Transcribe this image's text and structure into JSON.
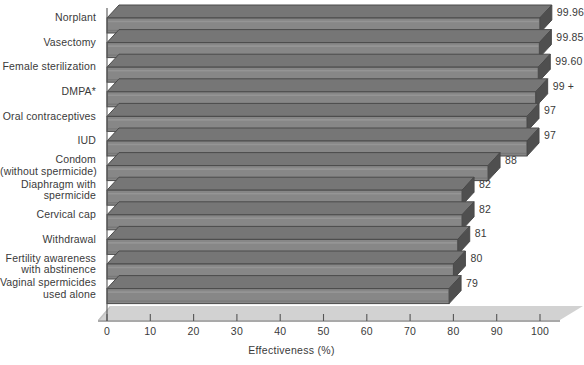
{
  "chart_data": {
    "type": "bar",
    "orientation": "horizontal",
    "title": "",
    "xlabel": "Effectiveness (%)",
    "ylabel": "",
    "xlim": [
      0,
      100
    ],
    "xticks": [
      0,
      10,
      20,
      30,
      40,
      50,
      60,
      70,
      80,
      90,
      100
    ],
    "xtick_labels": [
      "0",
      "10",
      "20",
      "30",
      "40",
      "50",
      "60",
      "70",
      "80",
      "90",
      "100"
    ],
    "grid": false,
    "legend": "none",
    "style": "3d-horizontal-bars-grayscale",
    "categories": [
      "Norplant",
      "Vasectomy",
      "Female sterilization",
      "DMPA*",
      "Oral contraceptives",
      "IUD",
      "Condom\n(without spermicide)",
      "Diaphragm with\nspermicide",
      "Cervical cap",
      "Withdrawal",
      "Fertility awareness\nwith abstinence",
      "Vaginal spermicides\nused alone"
    ],
    "values": [
      99.96,
      99.85,
      99.6,
      99,
      97,
      97,
      88,
      82,
      82,
      81,
      80,
      79
    ],
    "value_labels": [
      "99.96",
      "99.85",
      "99.60",
      "99 +",
      "97",
      "97",
      "88",
      "82",
      "82",
      "81",
      "80",
      "79"
    ],
    "colors": {
      "bar_front": "#878787",
      "bar_top": "#767676",
      "bar_side": "#4f4f4f",
      "bar_outline": "#4a4a4a",
      "floor": "#d3d3d3",
      "axis": "#555555",
      "text": "#3a3a3a",
      "background": "#ffffff"
    }
  },
  "axis": {
    "x_title": "Effectiveness (%)"
  },
  "footnote": {
    "text": ""
  }
}
